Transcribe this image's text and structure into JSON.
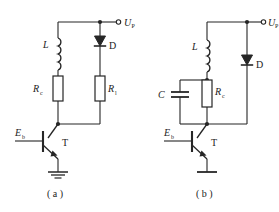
{
  "figure": {
    "background_color": "#ffffff",
    "line_color": "#262626",
    "text_color": "#1b1b1b",
    "panels": [
      {
        "id": "panel-a",
        "caption": "( a )",
        "supply_label": "U",
        "supply_subscript": "P",
        "inductor_label": "L",
        "diode_label": "D",
        "resistor_left_label": "R",
        "resistor_left_subscript": "c",
        "resistor_right_label": "R",
        "resistor_right_subscript": "l",
        "bias_label": "E",
        "bias_subscript": "b",
        "transistor_label": "T",
        "has_capacitor": false,
        "ground_style": "multi-bar"
      },
      {
        "id": "panel-b",
        "caption": "( b )",
        "supply_label": "U",
        "supply_subscript": "P",
        "inductor_label": "L",
        "diode_label": "D",
        "capacitor_label": "C",
        "resistor_left_label": "R",
        "resistor_left_subscript": "c",
        "bias_label": "E",
        "bias_subscript": "b",
        "transistor_label": "T",
        "has_capacitor": true,
        "ground_style": "single-bar"
      }
    ]
  }
}
